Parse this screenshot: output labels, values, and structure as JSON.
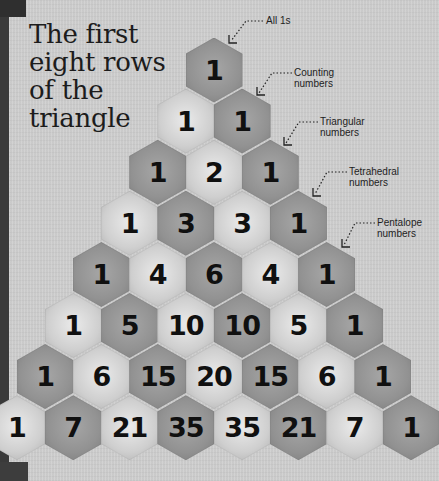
{
  "title": "The first\neight rows\nof the\ntriangle",
  "colors": {
    "background": "#cfcfcf",
    "hex_dark": "#929292",
    "hex_light": "#d4d4d4",
    "text": "#101010",
    "edge": "#3a3a3a"
  },
  "triangle": {
    "rows": [
      [
        1
      ],
      [
        1,
        1
      ],
      [
        1,
        2,
        1
      ],
      [
        1,
        3,
        3,
        1
      ],
      [
        1,
        4,
        6,
        4,
        1
      ],
      [
        1,
        5,
        10,
        10,
        5,
        1
      ],
      [
        1,
        6,
        15,
        20,
        15,
        6,
        1
      ],
      [
        1,
        7,
        21,
        35,
        35,
        21,
        7,
        1
      ]
    ]
  },
  "annotations": [
    {
      "label": "All 1s",
      "icon": "dotted-arrow-icon"
    },
    {
      "label": "Counting\nnumbers",
      "icon": "dotted-arrow-icon"
    },
    {
      "label": "Triangular\nnumbers",
      "icon": "dotted-arrow-icon"
    },
    {
      "label": "Tetrahedral\nnumbers",
      "icon": "dotted-arrow-icon"
    },
    {
      "label": "Pentalope\nnumbers",
      "icon": "dotted-arrow-icon"
    }
  ]
}
